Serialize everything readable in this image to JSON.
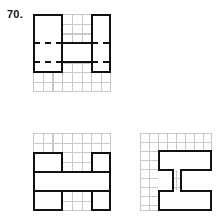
{
  "page": {
    "background_color": "#ffffff",
    "ink_color": "#111111",
    "grid_color": "#c9c9c9",
    "item_number": "70."
  },
  "figures": [
    {
      "id": "fig-top",
      "name": "question-figure",
      "role": "question",
      "grid": {
        "columns": 8,
        "rows": 8,
        "visible": true
      },
      "description": "Bold H-shaped outline on a light 8 by 8 grid with dashed horizontal interior segments",
      "strokes": [
        {
          "kind": "solid",
          "orientation": "vertical",
          "label": "left-outer-wall"
        },
        {
          "kind": "solid",
          "orientation": "vertical",
          "label": "left-inner-wall"
        },
        {
          "kind": "solid",
          "orientation": "vertical",
          "label": "right-inner-wall"
        },
        {
          "kind": "solid",
          "orientation": "vertical",
          "label": "right-outer-wall"
        },
        {
          "kind": "solid",
          "orientation": "horizontal",
          "label": "left-top-cap"
        },
        {
          "kind": "solid",
          "orientation": "horizontal",
          "label": "right-top-cap"
        },
        {
          "kind": "solid",
          "orientation": "horizontal",
          "label": "left-bottom-cap"
        },
        {
          "kind": "solid",
          "orientation": "horizontal",
          "label": "right-bottom-cap"
        },
        {
          "kind": "solid",
          "orientation": "horizontal",
          "label": "crossbar-upper"
        },
        {
          "kind": "solid",
          "orientation": "horizontal",
          "label": "crossbar-lower"
        },
        {
          "kind": "dashed",
          "orientation": "horizontal",
          "label": "dash-left-upper"
        },
        {
          "kind": "dashed",
          "orientation": "horizontal",
          "label": "dash-left-lower"
        },
        {
          "kind": "dashed",
          "orientation": "horizontal",
          "label": "dash-right-upper"
        },
        {
          "kind": "dashed",
          "orientation": "horizontal",
          "label": "dash-right-lower"
        }
      ]
    },
    {
      "id": "fig-a",
      "name": "answer-option-a",
      "role": "answer-option",
      "grid": {
        "columns": 8,
        "rows": 8,
        "visible": true
      },
      "description": "Bold H rotated ninety degrees on a light 8 by 8 grid, open bands at left and right of the middle row"
    },
    {
      "id": "fig-b",
      "name": "answer-option-b",
      "role": "answer-option",
      "grid": {
        "columns": 8,
        "rows": 8,
        "visible": true
      },
      "description": "Bold I-beam shape on a light 8 by 8 grid offset to the right side of the grid"
    }
  ]
}
